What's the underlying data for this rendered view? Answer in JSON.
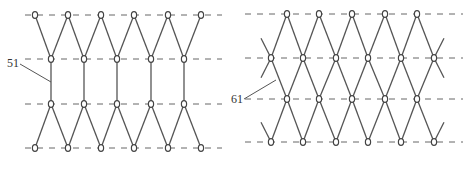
{
  "figures": [
    {
      "id": "left",
      "label": "51",
      "label_pos": {
        "x": 7,
        "y": 57
      },
      "leader": [
        [
          20,
          64
        ],
        [
          51,
          82
        ]
      ],
      "grid_lines_y": [
        15,
        59,
        104,
        148
      ],
      "grid_x_range": [
        25,
        222
      ],
      "rows": [
        {
          "y": 15,
          "nodes": [
            35,
            68,
            101,
            134,
            168,
            201
          ],
          "end_loops": true
        },
        {
          "y": 59,
          "nodes": [
            51,
            84,
            117,
            151,
            184
          ]
        },
        {
          "y": 104,
          "nodes": [
            51,
            84,
            117,
            151,
            184
          ]
        },
        {
          "y": 148,
          "nodes": [
            35,
            68,
            101,
            134,
            168,
            201
          ],
          "end_loops": true
        }
      ],
      "pattern": "zigzag-with-vertical-links"
    },
    {
      "id": "right",
      "label": "61",
      "label_pos": {
        "x": 231,
        "y": 93
      },
      "leader": [
        [
          244,
          99
        ],
        [
          276,
          80
        ]
      ],
      "grid_lines_y": [
        14,
        58,
        99,
        142
      ],
      "grid_x_range": [
        245,
        463
      ],
      "rows": [
        {
          "y": 14,
          "nodes": [
            287,
            319,
            352,
            385,
            417
          ]
        },
        {
          "y": 58,
          "nodes": [
            271,
            303,
            336,
            368,
            401,
            434
          ]
        },
        {
          "y": 99,
          "nodes": [
            287,
            319,
            352,
            385,
            417
          ]
        },
        {
          "y": 142,
          "nodes": [
            271,
            303,
            336,
            368,
            401,
            434
          ]
        }
      ],
      "pattern": "diamond-lattice"
    }
  ],
  "colors": {
    "line": "#555555",
    "dash": "#666666",
    "node": "#444444"
  }
}
